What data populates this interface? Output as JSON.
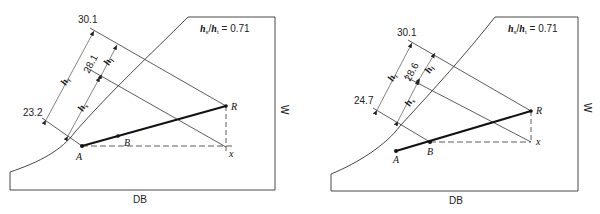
{
  "diagrams": [
    {
      "id": "left",
      "x_axis_label": "DB",
      "y_axis_label": "W",
      "ratio_label": "h_s/h_t = 0.71",
      "ratio": {
        "num": "h",
        "num_sub": "s",
        "den": "h",
        "den_sub": "t",
        "value": "= 0.71"
      },
      "enthalpy_values": {
        "top": "30.1",
        "middle": "28.1",
        "bottom": "23.2"
      },
      "dimension_labels": {
        "total": "h",
        "total_sub": "t",
        "latent": "h",
        "latent_sub": "l",
        "sensible": "h",
        "sensible_sub": "s"
      },
      "points": {
        "A": "A",
        "B": "B",
        "R": "R",
        "x": "x"
      }
    },
    {
      "id": "right",
      "x_axis_label": "DB",
      "y_axis_label": "W",
      "ratio_label": "h_s/h_t = 0.71",
      "ratio": {
        "num": "h",
        "num_sub": "s",
        "den": "h",
        "den_sub": "t",
        "value": "= 0.71"
      },
      "enthalpy_values": {
        "top": "30.1",
        "middle": "28.6",
        "bottom": "24.7"
      },
      "dimension_labels": {
        "total": "h",
        "total_sub": "t",
        "latent": "h",
        "latent_sub": "l",
        "sensible": "h",
        "sensible_sub": "s"
      },
      "points": {
        "A": "A",
        "B": "B",
        "R": "R",
        "x": "x"
      }
    }
  ]
}
